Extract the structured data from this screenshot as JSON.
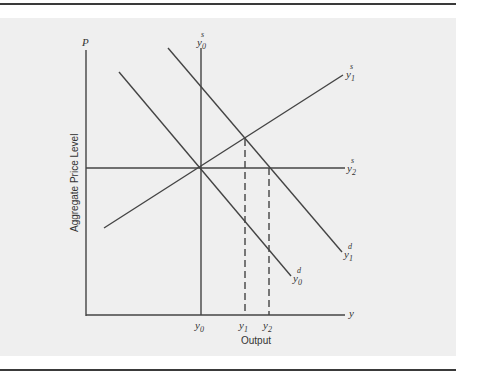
{
  "figure": {
    "axis_labels": {
      "y_axis_symbol": "P",
      "x_axis_symbol": "y",
      "y_axis_title": "Aggregate Price Level",
      "x_axis_title": "Output"
    },
    "curve_labels": {
      "y0_supply": {
        "base": "y",
        "sub": "0",
        "sup": "s"
      },
      "y1_supply": {
        "base": "y",
        "sub": "1",
        "sup": "s"
      },
      "y2_supply": {
        "base": "y",
        "sub": "2",
        "sup": "s"
      },
      "y0_demand": {
        "base": "y",
        "sub": "0",
        "sup": "d"
      },
      "y1_demand": {
        "base": "y",
        "sub": "1",
        "sup": "d"
      }
    },
    "x_ticks": [
      {
        "base": "y",
        "sub": "0"
      },
      {
        "base": "y",
        "sub": "1"
      },
      {
        "base": "y",
        "sub": "2"
      }
    ],
    "colors": {
      "line": "#444444",
      "panel": "#efefef",
      "rule": "#3a3a3a"
    }
  }
}
